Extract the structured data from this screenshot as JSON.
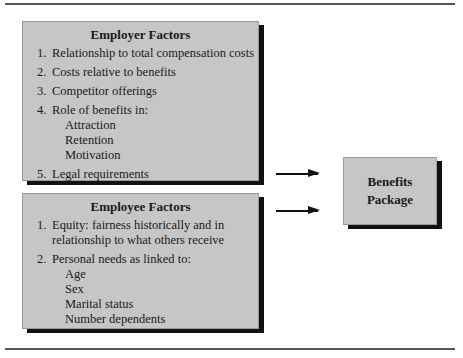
{
  "employer_box": {
    "title": "Employer Factors",
    "items": [
      {
        "num": "1.",
        "text": "Relationship to total compensation costs"
      },
      {
        "num": "2.",
        "text": "Costs relative to benefits"
      },
      {
        "num": "3.",
        "text": "Competitor offerings"
      },
      {
        "num": "4.",
        "text": "Role of benefits in:"
      },
      {
        "num": "5.",
        "text": "Legal requirements"
      }
    ],
    "subitems": [
      "Attraction",
      "Retention",
      "Motivation"
    ]
  },
  "employee_box": {
    "title": "Employee Factors",
    "items": [
      {
        "num": "1.",
        "text": "Equity: fairness historically and in",
        "text2": "relationship to what others receive"
      },
      {
        "num": "2.",
        "text": "Personal needs as linked to:"
      }
    ],
    "subitems": [
      "Age",
      "Sex",
      "Marital status",
      "Number dependents"
    ]
  },
  "benefits_box": {
    "line1": "Benefits",
    "line2": "Package"
  },
  "colors": {
    "box_fill": "#c6c6c6",
    "shadow": "#111111",
    "rule": "#555555"
  }
}
